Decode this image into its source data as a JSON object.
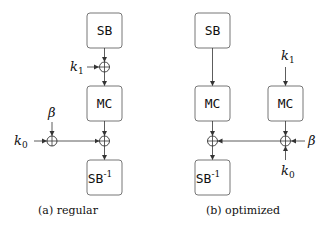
{
  "panels": [
    {
      "caption": "(a) regular",
      "boxes": {
        "sb": "SB",
        "mc": "MC",
        "sbinv": "SB",
        "sbinv_sup": "-1"
      },
      "inputs": {
        "k1": "k",
        "k1_sub": "1",
        "k0": "k",
        "k0_sub": "0",
        "beta": "β"
      }
    },
    {
      "caption": "(b) optimized",
      "boxes": {
        "sb": "SB",
        "mc": "MC",
        "mc2": "MC",
        "sbinv": "SB",
        "sbinv_sup": "-1"
      },
      "inputs": {
        "k1": "k",
        "k1_sub": "1",
        "k0": "k",
        "k0_sub": "0",
        "beta": "β"
      }
    }
  ],
  "colors": {
    "box_stroke": "#777777",
    "line": "#333333"
  }
}
